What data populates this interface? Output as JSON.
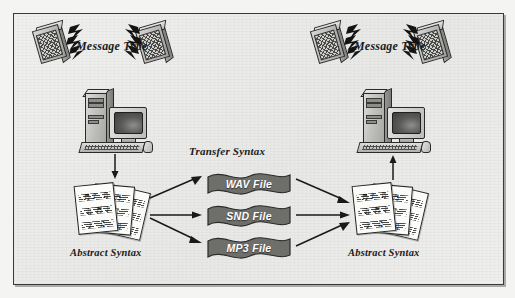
{
  "figure": {
    "background_color": "#ececeb",
    "border_color": "#3a3a3a",
    "banner_color": "#6e6e6b",
    "arrow_color": "#1a1a1a"
  },
  "labels": {
    "message_type_left": "Message Type",
    "message_type_right": "Message Type",
    "transfer_syntax": "Transfer Syntax",
    "abstract_syntax_left": "Abstract Syntax",
    "abstract_syntax_right": "Abstract Syntax"
  },
  "transfer_files": [
    {
      "label": "WAV File"
    },
    {
      "label": "SND File"
    },
    {
      "label": "MP3 File"
    }
  ],
  "nodes": {
    "left_computer": "desktop-computer",
    "right_computer": "desktop-computer",
    "left_speaker_a": "speaker",
    "left_speaker_b": "speaker",
    "right_speaker_a": "speaker",
    "right_speaker_b": "speaker",
    "left_sheet_music": "sheet-music-stack",
    "right_sheet_music": "sheet-music-stack"
  },
  "music_glyphs": [
    "♪",
    "♫",
    "♬",
    "♩"
  ]
}
